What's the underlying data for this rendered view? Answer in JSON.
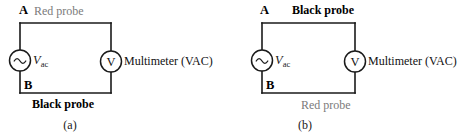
{
  "figure": {
    "background_color": "#ffffff",
    "line_color": "#1a1a1a",
    "gray_text_color": "#7b7b7b",
    "black_text_color": "#000000"
  },
  "panels": [
    {
      "id": "a",
      "caption": "(a)",
      "node_top": "A",
      "node_bottom": "B",
      "top_probe": {
        "text": "Red probe",
        "style": "gray",
        "color": "#7b7b7b"
      },
      "bottom_probe": {
        "text": "Black probe",
        "style": "black-bold",
        "color": "#000000"
      },
      "source": {
        "symbol": "~",
        "label_main": "V",
        "label_sub": "ac"
      },
      "meter": {
        "symbol": "V",
        "label": "Multimeter (VAC)"
      }
    },
    {
      "id": "b",
      "caption": "(b)",
      "node_top": "A",
      "node_bottom": "B",
      "top_probe": {
        "text": "Black probe",
        "style": "black-bold",
        "color": "#000000"
      },
      "bottom_probe": {
        "text": "Red probe",
        "style": "gray",
        "color": "#7b7b7b"
      },
      "source": {
        "symbol": "~",
        "label_main": "V",
        "label_sub": "ac"
      },
      "meter": {
        "symbol": "V",
        "label": "Multimeter (VAC)"
      }
    }
  ]
}
